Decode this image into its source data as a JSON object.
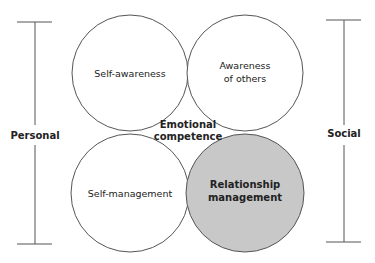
{
  "diagram": {
    "center_label": [
      "Emotional",
      "competence"
    ],
    "quadrants": [
      {
        "id": "self-awareness",
        "label": [
          "Self-awareness"
        ],
        "fill": "#ffffff",
        "bold": false
      },
      {
        "id": "awareness-of-others",
        "label": [
          "Awareness",
          "of others"
        ],
        "fill": "#ffffff",
        "bold": false
      },
      {
        "id": "self-management",
        "label": [
          "Self-management"
        ],
        "fill": "#ffffff",
        "bold": false
      },
      {
        "id": "relationship-management",
        "label": [
          "Relationship",
          "management"
        ],
        "fill": "#c8c8c8",
        "bold": true
      }
    ],
    "axes": [
      {
        "id": "personal",
        "label": "Personal"
      },
      {
        "id": "social",
        "label": "Social"
      }
    ],
    "colors": {
      "stroke": "#555555",
      "highlight_fill": "#c8c8c8",
      "text": "#222222"
    }
  }
}
